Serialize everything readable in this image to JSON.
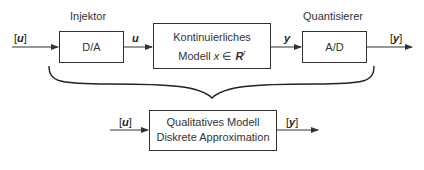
{
  "top_row": {
    "input_signal": {
      "open": "[",
      "var": "u",
      "close": "]"
    },
    "injector": {
      "caption": "Injektor",
      "box_label": "D/A"
    },
    "mid_signal_u": "u",
    "continuous_model": {
      "line1": "Kontinuierliches",
      "line2_prefix": "Modell ",
      "line2_var": "x",
      "line2_rel": " ∈ ",
      "line2_set": "R",
      "line2_sup": "r"
    },
    "mid_signal_y": "y",
    "quantizer": {
      "caption": "Quantisierer",
      "box_label": "A/D"
    },
    "output_signal": {
      "open": "[",
      "var": "y",
      "close": "]"
    }
  },
  "bottom_row": {
    "input_signal": {
      "open": "[",
      "var": "u",
      "close": "]"
    },
    "qualitative_model": {
      "line1": "Qualitatives Modell",
      "line2": "Diskrete Approximation"
    },
    "output_signal": {
      "open": "[",
      "var": "y",
      "close": "]"
    }
  },
  "colors": {
    "stroke": "#333333",
    "text": "#333333",
    "background": "#ffffff"
  }
}
